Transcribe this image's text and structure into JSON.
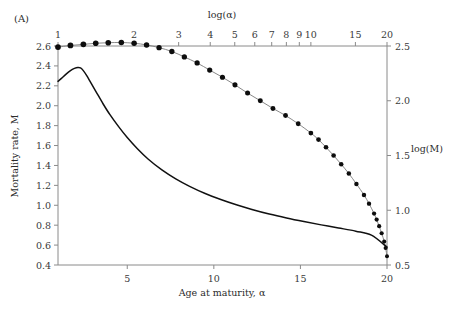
{
  "figure": {
    "panel_label": "(A)",
    "background": "#ffffff"
  },
  "axes": {
    "bottom": {
      "title": "Age at maturity, α",
      "scale": "linear",
      "range": [
        1,
        20
      ],
      "ticks": [
        5,
        10,
        15,
        20
      ],
      "tick_labels": [
        "5",
        "10",
        "15",
        "20"
      ]
    },
    "top": {
      "title": "log(α)",
      "scale": "log",
      "range": [
        1,
        20
      ],
      "ticks": [
        1,
        2,
        3,
        4,
        5,
        6,
        7,
        8,
        9,
        10,
        15,
        20
      ],
      "tick_labels": [
        "1",
        "2",
        "3",
        "4",
        "5",
        "6",
        "7",
        "8",
        "9",
        "10",
        "15",
        "20"
      ]
    },
    "left": {
      "title": "Mortality rate, M",
      "scale": "linear",
      "range": [
        0.4,
        2.6
      ],
      "ticks": [
        0.4,
        0.6,
        0.8,
        1.0,
        1.2,
        1.4,
        1.6,
        1.8,
        2.0,
        2.2,
        2.4,
        2.6
      ],
      "tick_labels": [
        "0.4",
        "0.6",
        "0.8",
        "1.0",
        "1.2",
        "1.4",
        "1.6",
        "1.8",
        "2.0",
        "2.2",
        "2.4",
        "2.6"
      ]
    },
    "right": {
      "title": "log(M)",
      "scale": "linear",
      "range": [
        0.5,
        2.5
      ],
      "ticks": [
        0.5,
        1.0,
        1.5,
        2.0,
        2.5
      ],
      "tick_labels": [
        "0.5",
        "1.0",
        "1.5",
        "2.0",
        "2.5"
      ]
    }
  },
  "chart_data": {
    "type": "line",
    "title": "",
    "subtitle": "",
    "panel": "(A)",
    "xlabel": "Age at maturity, α",
    "ylabel": "Mortality rate, M",
    "xlabel_top": "log(α)",
    "ylabel_right": "log(M)",
    "xlim": [
      1,
      20
    ],
    "ylim": [
      0.4,
      2.6
    ],
    "xlim_top": [
      1,
      20
    ],
    "ylim_right": [
      0.5,
      2.5
    ],
    "grid": false,
    "legend": null,
    "series": [
      {
        "name": "log(M) vs log(alpha)",
        "style": "markers-with-line",
        "marker": "filled-circle",
        "color": "#0d0d0d",
        "x_axis": "top",
        "y_axis": "right",
        "note": "points equally spaced in log(alpha); spacing compresses toward alpha = 20",
        "x": [
          1.0,
          1.12,
          1.26,
          1.41,
          1.58,
          1.78,
          2.0,
          2.24,
          2.51,
          2.82,
          3.16,
          3.55,
          3.98,
          4.47,
          5.01,
          5.62,
          6.31,
          7.08,
          7.94,
          8.91,
          10.0,
          10.72,
          11.48,
          12.3,
          13.18,
          14.13,
          15.14,
          16.22,
          16.98,
          17.78,
          18.2,
          18.62,
          19.05,
          19.5,
          19.75,
          20.0
        ],
        "y": [
          2.49,
          2.505,
          2.515,
          2.525,
          2.53,
          2.532,
          2.525,
          2.51,
          2.485,
          2.45,
          2.4,
          2.345,
          2.28,
          2.215,
          2.145,
          2.07,
          2.0,
          1.93,
          1.865,
          1.79,
          1.705,
          1.645,
          1.575,
          1.5,
          1.42,
          1.335,
          1.24,
          1.14,
          1.06,
          0.97,
          0.915,
          0.855,
          0.79,
          0.715,
          0.655,
          0.58
        ]
      },
      {
        "name": "M vs alpha",
        "style": "solid-line",
        "color": "#111111",
        "x_axis": "bottom",
        "y_axis": "left",
        "note": "sharp rise to a peak near alpha = 2.3 then monotonic decline to alpha = 20",
        "x": [
          1.0,
          1.2,
          1.45,
          1.7,
          1.95,
          2.15,
          2.3,
          2.45,
          2.65,
          2.9,
          3.2,
          3.6,
          4.0,
          4.5,
          5.0,
          5.6,
          6.2,
          7.0,
          7.8,
          8.6,
          9.5,
          10.4,
          11.3,
          12.2,
          13.2,
          14.2,
          15.2,
          16.2,
          17.2,
          18.2,
          19.1,
          20.0
        ],
        "y": [
          2.245,
          2.275,
          2.315,
          2.35,
          2.375,
          2.385,
          2.38,
          2.355,
          2.305,
          2.23,
          2.14,
          2.02,
          1.91,
          1.79,
          1.68,
          1.565,
          1.465,
          1.355,
          1.265,
          1.19,
          1.118,
          1.058,
          1.005,
          0.958,
          0.912,
          0.872,
          0.836,
          0.803,
          0.772,
          0.74,
          0.7,
          0.58
        ]
      }
    ],
    "annotations": [
      {
        "text": "(A)",
        "position": "top-left"
      }
    ]
  }
}
